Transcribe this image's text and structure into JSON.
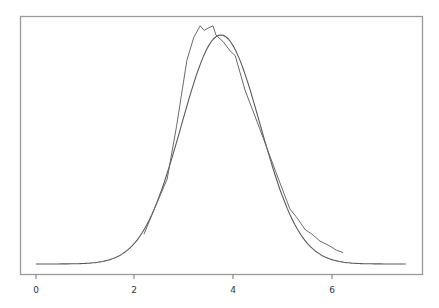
{
  "chart_data": {
    "type": "line",
    "title": "",
    "xlabel": "",
    "ylabel": "",
    "xlim": [
      -0.33,
      7.72
    ],
    "ylim": [
      -0.045,
      1.08
    ],
    "grid": false,
    "legend": null,
    "x_ticks": [
      0,
      2,
      4,
      6
    ],
    "x_tick_labels": [
      "0",
      "2",
      "4",
      "6"
    ],
    "y_ticks": [],
    "series": [
      {
        "name": "fitted normal density",
        "style": "smooth",
        "mean": 3.75,
        "sd": 0.8,
        "x_range": [
          0,
          7.5
        ],
        "peak": 1.0
      },
      {
        "name": "empirical density",
        "style": "jagged",
        "x": [
          2.19,
          2.4,
          2.66,
          2.85,
          3.06,
          3.2,
          3.33,
          3.41,
          3.49,
          3.59,
          3.65,
          3.8,
          3.94,
          4.04,
          4.24,
          4.54,
          4.85,
          5.15,
          5.3,
          5.46,
          5.6,
          5.76,
          5.95,
          6.1,
          6.23
        ],
        "y": [
          0.13,
          0.24,
          0.37,
          0.6,
          0.89,
          0.99,
          1.04,
          1.02,
          1.03,
          1.04,
          1.0,
          0.97,
          0.93,
          0.91,
          0.76,
          0.59,
          0.41,
          0.24,
          0.2,
          0.15,
          0.13,
          0.1,
          0.08,
          0.06,
          0.05
        ]
      }
    ]
  },
  "axis": {
    "tick_labels": [
      "0",
      "2",
      "4",
      "6"
    ]
  }
}
